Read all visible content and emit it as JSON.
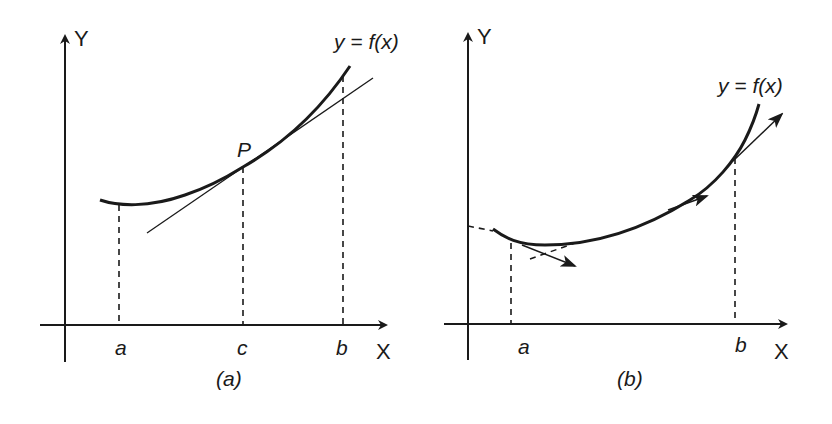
{
  "figure": {
    "panels": [
      {
        "id": "a",
        "caption": "(a)",
        "y_axis_label": "Y",
        "x_axis_label": "X",
        "curve_label": "y = f(x)",
        "point_label": "P",
        "x_ticks": [
          "a",
          "c",
          "b"
        ],
        "description": "Curve y = f(x) on [a, b] with tangent line at point P above x = c"
      },
      {
        "id": "b",
        "caption": "(b)",
        "y_axis_label": "Y",
        "x_axis_label": "X",
        "curve_label": "y = f(x)",
        "x_ticks": [
          "a",
          "b"
        ],
        "description": "Curve y = f(x) on [a, b] with tangent direction arrows along the curve"
      }
    ],
    "colors": {
      "ink": "#1a1a1a",
      "background": "#ffffff"
    }
  }
}
